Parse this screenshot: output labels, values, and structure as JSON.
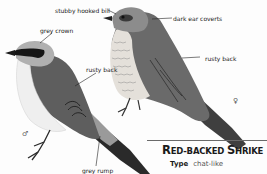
{
  "species": {
    "title": "Red-backed Shrike",
    "title_parts": [
      {
        "cap": "R",
        "rest": "ED-BACKED "
      },
      {
        "cap": "S",
        "rest": "HRIKE"
      }
    ],
    "fields": [
      {
        "key": "Type",
        "value": "chat-like"
      }
    ]
  },
  "illustrations": {
    "male": {
      "sex_symbol": "♂",
      "labels": [
        "grey crown",
        "rusty back",
        "grey rump"
      ]
    },
    "female": {
      "sex_symbol": "♀",
      "labels": [
        "stubby hooked bill",
        "dark ear coverts",
        "rusty back"
      ]
    }
  },
  "colors": {
    "back": "#5b5b5b",
    "crown": "#a9a9a9",
    "mask": "#1a1a1a",
    "underparts": "#ececec",
    "rule": "#6a6a6a"
  }
}
